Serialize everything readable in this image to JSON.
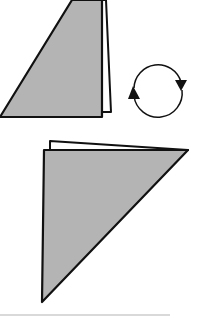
{
  "diagram": {
    "type": "origami-step",
    "colors": {
      "paper_fill": "#b4b4b4",
      "paper_back": "#ffffff",
      "stroke": "#111111",
      "divider": "#cccccc"
    },
    "steps": [
      {
        "id": "before",
        "shape": "folded-triangle-right-angle-bottom-right"
      },
      {
        "id": "turn-over",
        "symbol": "rotate-arrows-circle"
      },
      {
        "id": "after",
        "shape": "folded-triangle-right-angle-top-left"
      }
    ]
  }
}
